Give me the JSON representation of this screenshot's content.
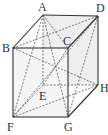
{
  "figure": {
    "vertices": {
      "A": {
        "label": "A",
        "x": 43,
        "y": 15
      },
      "D": {
        "label": "D",
        "x": 98,
        "y": 16
      },
      "B": {
        "label": "B",
        "x": 13,
        "y": 48
      },
      "C": {
        "label": "C",
        "x": 68,
        "y": 48
      },
      "E": {
        "label": "E",
        "x": 43,
        "y": 85
      },
      "H": {
        "label": "H",
        "x": 98,
        "y": 85
      },
      "F": {
        "label": "F",
        "x": 13,
        "y": 117
      },
      "G": {
        "label": "G",
        "x": 68,
        "y": 117
      }
    },
    "solid_edges": [
      "AB",
      "AD",
      "BC",
      "CD",
      "DH",
      "HG",
      "BF",
      "FG",
      "CG"
    ],
    "hidden_edges": [
      "AE",
      "EH",
      "EF"
    ],
    "diagonals": [
      "AC",
      "BD",
      "AF",
      "AG",
      "DF",
      "BH",
      "CE",
      "FH",
      "DG"
    ]
  }
}
